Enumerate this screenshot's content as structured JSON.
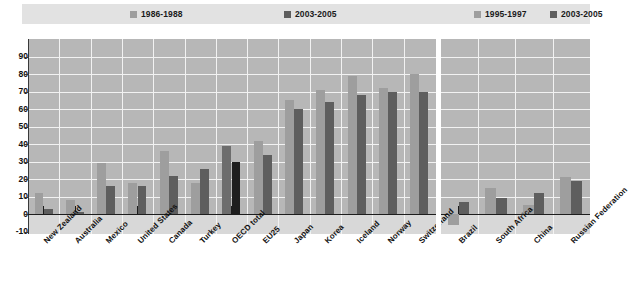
{
  "legend": {
    "left_panel": [
      {
        "label": "1986-1988",
        "color": "#9e9e9e"
      },
      {
        "label": "2003-2005",
        "color": "#5e5e5e"
      }
    ],
    "right_panel": [
      {
        "label": "1995-1997",
        "color": "#9e9e9e"
      },
      {
        "label": "2003-2005",
        "color": "#5e5e5e"
      }
    ]
  },
  "axis": {
    "y_ticks": [
      "90",
      "80",
      "70",
      "60",
      "50",
      "40",
      "30",
      "20",
      "10",
      "0",
      "-10"
    ],
    "ymin": -10,
    "ymax": 90,
    "ystep": 10
  },
  "chart_data": {
    "type": "bar",
    "title": "",
    "xlabel": "",
    "ylabel": "",
    "ylim": [
      -10,
      90
    ],
    "grid": true,
    "legend_position": "top",
    "panels": [
      {
        "name": "OECD countries",
        "series": [
          {
            "name": "1986-1988",
            "color": "#9e9e9e"
          },
          {
            "name": "2003-2005",
            "color": "#5e5e5e"
          }
        ],
        "categories": [
          "New Zealand",
          "Australia",
          "Mexico",
          "United States",
          "Canada",
          "Turkey",
          "OECD total",
          "EU25",
          "Japan",
          "Korea",
          "Iceland",
          "Norway",
          "Switzerland"
        ],
        "values": {
          "1986-1988": [
            12,
            8,
            29,
            18,
            36,
            18,
            39,
            42,
            65,
            71,
            79,
            72,
            80
          ],
          "2003-2005": [
            3,
            1,
            16,
            16,
            22,
            26,
            30,
            34,
            60,
            64,
            68,
            70,
            70
          ]
        },
        "highlight_category": "OECD total",
        "highlight_colors": {
          "1986-1988": "#6d6d6d",
          "2003-2005": "#1e1e1e"
        }
      },
      {
        "name": "Non-OECD economies",
        "series": [
          {
            "name": "1995-1997",
            "color": "#9e9e9e"
          },
          {
            "name": "2003-2005",
            "color": "#5e5e5e"
          }
        ],
        "categories": [
          "Brazil",
          "South Africa",
          "China",
          "Russian Federation"
        ],
        "values": {
          "1995-1997": [
            -6,
            15,
            5,
            21
          ],
          "2003-2005": [
            7,
            9,
            12,
            19
          ]
        }
      }
    ]
  },
  "colors": {
    "plot_background": "#b7b7b7",
    "lower_background": "#d8d8d8",
    "legend_background": "#e2e2e2",
    "gridline": "#f2f2f2",
    "axis": "#1d1d1d",
    "light_series": "#9e9e9e",
    "dark_series": "#5e5e5e"
  }
}
